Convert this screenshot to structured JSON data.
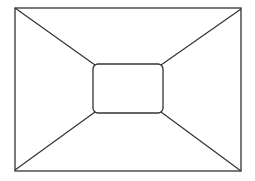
{
  "diagram": {
    "type": "perspective-room",
    "stroke_color": "#333333",
    "background": "#ffffff",
    "outer_rect": {
      "x": 15,
      "y": 8,
      "width": 226,
      "height": 163
    },
    "inner_rect": {
      "x": 93,
      "y": 64,
      "width": 70,
      "height": 49,
      "rx": 5
    },
    "connectors": [
      {
        "x1": 15,
        "y1": 8,
        "x2": 95,
        "y2": 65
      },
      {
        "x1": 241,
        "y1": 9,
        "x2": 161,
        "y2": 65
      },
      {
        "x1": 15,
        "y1": 170,
        "x2": 95,
        "y2": 112
      },
      {
        "x1": 241,
        "y1": 171,
        "x2": 161,
        "y2": 112
      }
    ]
  }
}
